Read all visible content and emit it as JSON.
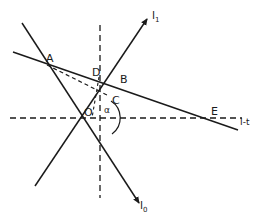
{
  "diagram": {
    "type": "geometric-construction",
    "colors": {
      "stroke": "#1a1a1a",
      "background": "#ffffff"
    },
    "points": {
      "A": {
        "label": "A",
        "x": 47,
        "y": 65
      },
      "B": {
        "label": "B",
        "x": 117,
        "y": 82
      },
      "C": {
        "label": "C",
        "x": 109,
        "y": 96
      },
      "D": {
        "label": "D",
        "x": 99,
        "y": 77
      },
      "E": {
        "label": "E",
        "x": 216,
        "y": 119
      },
      "O": {
        "label": "O",
        "x": 100,
        "y": 118
      }
    },
    "lines": {
      "l1": {
        "label_main": "l",
        "label_sub": "1",
        "style": "solid-arrow"
      },
      "l0": {
        "label_main": "l",
        "label_sub": "0",
        "style": "solid-arrow"
      },
      "AE": {
        "style": "solid"
      },
      "horizontal_axis": {
        "label": "I-t",
        "style": "dashed"
      },
      "vertical_axis": {
        "style": "dashed"
      },
      "AC": {
        "style": "dashed"
      },
      "DO": {
        "style": "dashed"
      }
    },
    "angle": {
      "label": "α",
      "at": "O"
    }
  }
}
